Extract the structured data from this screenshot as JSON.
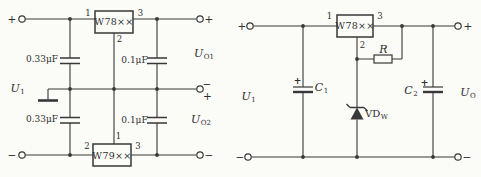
{
  "left_circuit": {
    "reg_top": {
      "name": "W78××",
      "pin1": "1",
      "pin2": "2",
      "pin3": "3"
    },
    "reg_bottom": {
      "name": "W79××",
      "pin1": "1",
      "pin2": "2",
      "pin3": "3"
    },
    "cap_top_in": "0.33μF",
    "cap_top_out": "0.1μF",
    "cap_bottom_in": "0.33μF",
    "cap_bottom_out": "0.1μF",
    "u_in": {
      "base": "U",
      "sub": "1"
    },
    "u_out1": {
      "base": "U",
      "sub": "O1"
    },
    "u_out2": {
      "base": "U",
      "sub": "O2"
    },
    "term_top_left": "+",
    "term_top_right": "+",
    "term_mid_top": "−",
    "term_mid_bottom": "+",
    "term_bottom_left": "−",
    "term_bottom_right": "−"
  },
  "right_circuit": {
    "reg": {
      "name": "W78××",
      "pin1": "1",
      "pin2": "2",
      "pin3": "3"
    },
    "resistor": "R",
    "zener": {
      "base": "VD",
      "sub": "W"
    },
    "cap_in": {
      "base": "C",
      "sub": "1",
      "polarity": "+"
    },
    "cap_out": {
      "base": "C",
      "sub": "2",
      "polarity": "+"
    },
    "u_in": {
      "base": "U",
      "sub": "1"
    },
    "u_out": {
      "base": "U",
      "sub": "O"
    },
    "term_top_left": "+",
    "term_top_right": "+",
    "term_bottom_left": "−",
    "term_bottom_right": "−"
  },
  "colors": {
    "line": "#383838",
    "paper": "#fbfbf8"
  }
}
